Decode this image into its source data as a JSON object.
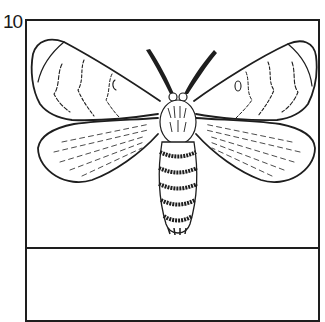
{
  "figure": {
    "number": "10",
    "caption": ""
  },
  "colors": {
    "ink": "#1e1e1e",
    "paper": "#ffffff"
  }
}
